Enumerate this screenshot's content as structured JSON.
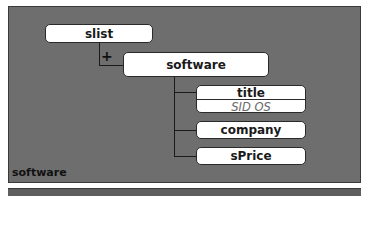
{
  "diagram": {
    "caption": "software",
    "root": {
      "label": "slist"
    },
    "expand_marker": "+",
    "child": {
      "label": "software"
    },
    "fields": [
      {
        "label": "title",
        "value": "SID OS"
      },
      {
        "label": "company"
      },
      {
        "label": "sPrice"
      }
    ]
  },
  "colors": {
    "panel_bg": "#6e6e6e",
    "node_bg": "#ffffff",
    "line": "#1a1a1a",
    "value_text": "#6a6a6a"
  }
}
